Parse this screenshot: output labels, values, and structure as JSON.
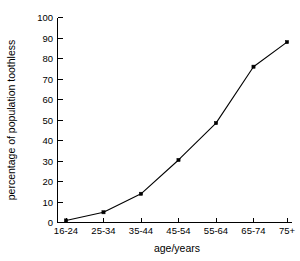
{
  "chart_data": {
    "type": "line",
    "title": "",
    "xlabel": "age/years",
    "ylabel": "percentage of population toothless",
    "categories": [
      "16-24",
      "25-34",
      "35-44",
      "45-54",
      "55-64",
      "65-74",
      "75+"
    ],
    "values": [
      1,
      5,
      14,
      30.5,
      48.5,
      76,
      88
    ],
    "series": [
      {
        "name": "percentage of population toothless",
        "values": [
          1,
          5,
          14,
          30.5,
          48.5,
          76,
          88
        ]
      }
    ],
    "ylim": [
      0,
      100
    ],
    "yticks": [
      0,
      10,
      20,
      30,
      40,
      50,
      60,
      70,
      80,
      90,
      100
    ],
    "ytick_labels": [
      "0",
      "10",
      "20",
      "30",
      "40",
      "50",
      "60",
      "70",
      "80",
      "90",
      "100"
    ],
    "xtick_labels": [
      "16-24",
      "25-34",
      "35-44",
      "45-54",
      "55-64",
      "65-74",
      "75+"
    ],
    "grid": false,
    "legend": false,
    "legend_position": "none",
    "marker": "square",
    "line_color": "#000000",
    "marker_color": "#000000",
    "background_color": "#ffffff",
    "axis_color": "#000000",
    "spines": [
      "left",
      "bottom"
    ],
    "tick_direction": "in"
  }
}
